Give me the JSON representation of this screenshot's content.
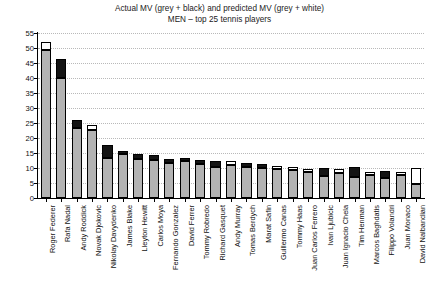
{
  "chart_data": {
    "type": "bar",
    "title": "Actual MV (grey + black) and predicted MV (grey + white)",
    "subtitle": "MEN – top 25 tennis players",
    "xlabel": "",
    "ylabel": "",
    "ylim": [
      0,
      55
    ],
    "yticks": [
      0,
      5,
      10,
      15,
      20,
      25,
      30,
      35,
      40,
      45,
      50,
      55
    ],
    "grid": true,
    "legend_position": "none",
    "stacking": "overlay",
    "categories": [
      "Roger Federer",
      "Rafa Nadal",
      "Andy Roddick",
      "Novak Djokovic",
      "Nikolay Davydenko",
      "James Blake",
      "Lleyton Hewitt",
      "Carlos Moya",
      "Fernando Gonzalez",
      "David Ferrer",
      "Tommy Robredo",
      "Richard Gasquet",
      "Andy Murray",
      "Tomas Berdych",
      "Marat Safin",
      "Guillermo Canas",
      "Tommy Haas",
      "Juan Carlos Ferrero",
      "Ivan Ljubicic",
      "Juan Ignacio Chela",
      "Tim Henman",
      "Marcos Baghdatis",
      "Filippo Volandri",
      "Juan Monaco",
      "David Nalbandian"
    ],
    "series": [
      {
        "name": "grey (common base)",
        "color": "#b3b3b3",
        "values": [
          49.5,
          40.0,
          23.5,
          22.8,
          13.5,
          14.6,
          13.0,
          12.6,
          11.8,
          12.5,
          11.3,
          10.4,
          11.0,
          10.2,
          10.0,
          9.6,
          9.4,
          8.8,
          7.3,
          8.4,
          7.0,
          7.8,
          6.6,
          7.6,
          4.8
        ]
      },
      {
        "name": "actual MV (grey + black)",
        "color": "#141414",
        "values": [
          49.5,
          46.5,
          26.0,
          22.8,
          17.8,
          15.8,
          14.6,
          14.5,
          13.0,
          13.2,
          12.6,
          12.2,
          11.0,
          11.8,
          11.4,
          9.6,
          9.4,
          8.8,
          10.0,
          8.4,
          10.2,
          7.8,
          9.0,
          7.6,
          4.8
        ]
      },
      {
        "name": "predicted MV (grey + white)",
        "color": "#ffffff",
        "values": [
          52.0,
          40.0,
          23.5,
          24.2,
          13.5,
          14.6,
          13.0,
          12.6,
          11.8,
          12.5,
          11.3,
          10.4,
          12.2,
          10.2,
          10.0,
          10.8,
          10.3,
          9.8,
          7.3,
          9.6,
          7.0,
          8.6,
          6.6,
          8.6,
          10.0
        ]
      }
    ]
  },
  "axis": {
    "y_tick_labels": [
      "0",
      "5",
      "10",
      "15",
      "20",
      "25",
      "30",
      "35",
      "40",
      "45",
      "50",
      "55"
    ]
  }
}
